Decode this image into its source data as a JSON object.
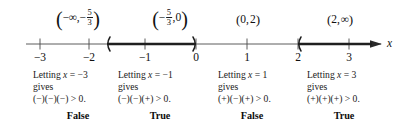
{
  "figure": {
    "axis_variable": "x",
    "line_color": "#3a3a3a",
    "bold_color": "#1a1a1a"
  },
  "intervals": [
    {
      "id": "interval-neg-inf-to-neg-five-thirds",
      "open": "(",
      "left": "−∞",
      "comma": ",",
      "right_kind": "fraction",
      "right_sign": "−",
      "right_num": "5",
      "right_den": "3",
      "close": ")",
      "text": "(−∞, −5/3)",
      "center_x": 78
    },
    {
      "id": "interval-neg-five-thirds-to-zero",
      "open": "(",
      "left_kind": "fraction",
      "left_sign": "−",
      "left_num": "5",
      "left_den": "3",
      "comma": ",",
      "right": "0",
      "close": ")",
      "text": "(−5/3, 0)",
      "center_x": 170
    },
    {
      "id": "interval-zero-to-two",
      "open": "(",
      "left": "0",
      "comma": ",",
      "right": "2",
      "close": ")",
      "text": "(0, 2)",
      "center_x": 248
    },
    {
      "id": "interval-two-to-inf",
      "open": "(",
      "left": "2",
      "comma": ",",
      "right": "∞",
      "close": ")",
      "text": "(2, ∞)",
      "center_x": 340
    }
  ],
  "axis": {
    "ticks": [
      {
        "label": "−3",
        "x": 40
      },
      {
        "label": "−2",
        "x": 89
      },
      {
        "label": "−1",
        "x": 145
      },
      {
        "label": "0",
        "x": 196
      },
      {
        "label": "1",
        "x": 247
      },
      {
        "label": "2",
        "x": 298
      },
      {
        "label": "3",
        "x": 349
      }
    ],
    "variable_label": "x",
    "solution_segments": [
      {
        "id": "segment-neg-five-thirds-to-zero",
        "from_x": 107,
        "to_x": 196,
        "left_endpoint": "open",
        "right_endpoint": "open"
      },
      {
        "id": "segment-two-to-infinity",
        "from_x": 298,
        "to_x": 382,
        "left_endpoint": "open",
        "right_endpoint": "arrow"
      }
    ]
  },
  "tests": [
    {
      "id": "test-x-neg-3",
      "line1_pre": "Letting ",
      "line1_var": "x",
      "line1_post": " = −3",
      "line2": "gives",
      "line3": "(−)(−)(−) > 0.",
      "verdict": "False",
      "left_x": 33,
      "verdict_x": 78
    },
    {
      "id": "test-x-neg-1",
      "line1_pre": "Letting ",
      "line1_var": "x",
      "line1_post": " = −1",
      "line2": "gives",
      "line3": "(−)(−)(+) > 0.",
      "verdict": "True",
      "left_x": 118,
      "verdict_x": 160
    },
    {
      "id": "test-x-1",
      "line1_pre": "Letting ",
      "line1_var": "x",
      "line1_post": " = 1",
      "line2": "gives",
      "line3": "(+)(−)(+) > 0.",
      "verdict": "False",
      "left_x": 218,
      "verdict_x": 252
    },
    {
      "id": "test-x-3",
      "line1_pre": "Letting ",
      "line1_var": "x",
      "line1_post": " = 3",
      "line2": "gives",
      "line3": "(+)(+)(+) > 0.",
      "verdict": "True",
      "left_x": 307,
      "verdict_x": 344
    }
  ]
}
